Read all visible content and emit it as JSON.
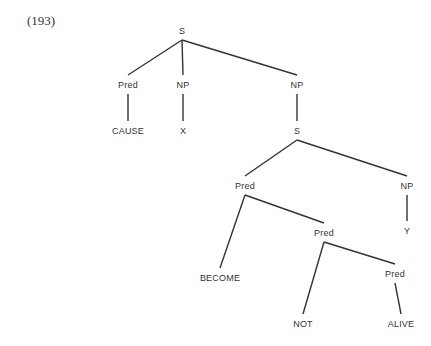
{
  "example_number": "(193)",
  "tree": {
    "nodes": [
      {
        "id": "s1",
        "label": "S",
        "x": 182,
        "y": 31
      },
      {
        "id": "pred1",
        "label": "Pred",
        "x": 128,
        "y": 85
      },
      {
        "id": "np1",
        "label": "NP",
        "x": 183,
        "y": 85
      },
      {
        "id": "np2",
        "label": "NP",
        "x": 297,
        "y": 85
      },
      {
        "id": "cause",
        "label": "CAUSE",
        "x": 128,
        "y": 131
      },
      {
        "id": "x",
        "label": "X",
        "x": 183,
        "y": 131
      },
      {
        "id": "s2",
        "label": "S",
        "x": 297,
        "y": 131
      },
      {
        "id": "pred2",
        "label": "Pred",
        "x": 245,
        "y": 186
      },
      {
        "id": "np3",
        "label": "NP",
        "x": 407,
        "y": 186
      },
      {
        "id": "pred3",
        "label": "Pred",
        "x": 324,
        "y": 233
      },
      {
        "id": "y",
        "label": "Y",
        "x": 407,
        "y": 231
      },
      {
        "id": "become",
        "label": "BECOME",
        "x": 220,
        "y": 278
      },
      {
        "id": "pred4",
        "label": "Pred",
        "x": 395,
        "y": 274
      },
      {
        "id": "not",
        "label": "NOT",
        "x": 303,
        "y": 324
      },
      {
        "id": "alive",
        "label": "ALIVE",
        "x": 401,
        "y": 324
      }
    ],
    "edges": [
      [
        "s1",
        "pred1"
      ],
      [
        "s1",
        "np1"
      ],
      [
        "s1",
        "np2"
      ],
      [
        "pred1",
        "cause"
      ],
      [
        "np1",
        "x"
      ],
      [
        "np2",
        "s2"
      ],
      [
        "s2",
        "pred2"
      ],
      [
        "s2",
        "np3"
      ],
      [
        "pred2",
        "become"
      ],
      [
        "pred2",
        "pred3"
      ],
      [
        "np3",
        "y"
      ],
      [
        "pred3",
        "not"
      ],
      [
        "pred3",
        "pred4"
      ],
      [
        "pred4",
        "alive"
      ]
    ]
  }
}
